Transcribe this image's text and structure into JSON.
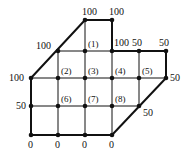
{
  "diagram": {
    "nodes": [
      {
        "id": "t1",
        "x": 85,
        "y": 20,
        "type": "boundary",
        "label": "100",
        "lx": -3,
        "ly": -5
      },
      {
        "id": "t2",
        "x": 112,
        "y": 20,
        "type": "boundary",
        "label": "100",
        "lx": -3,
        "ly": -5
      },
      {
        "id": "r1a",
        "x": 58,
        "y": 51,
        "type": "boundary",
        "label": "100",
        "lx": -22,
        "ly": -2
      },
      {
        "id": "n1",
        "x": 85,
        "y": 51,
        "type": "interior",
        "label": "(1)",
        "lx": 3,
        "ly": -4
      },
      {
        "id": "r1c",
        "x": 112,
        "y": 51,
        "type": "boundary",
        "label": "100",
        "lx": 2,
        "ly": -5
      },
      {
        "id": "r1d",
        "x": 139,
        "y": 51,
        "type": "boundary",
        "label": "50",
        "lx": -7,
        "ly": -5
      },
      {
        "id": "r1e",
        "x": 166,
        "y": 51,
        "type": "boundary",
        "label": "50",
        "lx": -7,
        "ly": -5
      },
      {
        "id": "r2a",
        "x": 31,
        "y": 78,
        "type": "boundary",
        "label": "100",
        "lx": -22,
        "ly": 3
      },
      {
        "id": "n2",
        "x": 58,
        "y": 78,
        "type": "interior",
        "label": "(2)",
        "lx": 3,
        "ly": -4
      },
      {
        "id": "n3",
        "x": 85,
        "y": 78,
        "type": "interior",
        "label": "(3)",
        "lx": 3,
        "ly": -4
      },
      {
        "id": "n4",
        "x": 112,
        "y": 78,
        "type": "interior",
        "label": "(4)",
        "lx": 3,
        "ly": -4
      },
      {
        "id": "n5",
        "x": 139,
        "y": 78,
        "type": "interior",
        "label": "(5)",
        "lx": 3,
        "ly": -4
      },
      {
        "id": "r2f",
        "x": 166,
        "y": 78,
        "type": "boundary",
        "label": "50",
        "lx": 4,
        "ly": 3
      },
      {
        "id": "r3a",
        "x": 31,
        "y": 106,
        "type": "boundary",
        "label": "50",
        "lx": -15,
        "ly": 3
      },
      {
        "id": "n6",
        "x": 58,
        "y": 106,
        "type": "interior",
        "label": "(6)",
        "lx": 3,
        "ly": -4
      },
      {
        "id": "n7",
        "x": 85,
        "y": 106,
        "type": "interior",
        "label": "(7)",
        "lx": 3,
        "ly": -4
      },
      {
        "id": "n8",
        "x": 112,
        "y": 106,
        "type": "interior",
        "label": "(8)",
        "lx": 3,
        "ly": -4
      },
      {
        "id": "r3e",
        "x": 139,
        "y": 106,
        "type": "boundary",
        "label": "50",
        "lx": 4,
        "ly": 10
      },
      {
        "id": "b1",
        "x": 31,
        "y": 135,
        "type": "boundary",
        "label": "0",
        "lx": -3,
        "ly": 13
      },
      {
        "id": "b2",
        "x": 58,
        "y": 135,
        "type": "boundary",
        "label": "0",
        "lx": -3,
        "ly": 13
      },
      {
        "id": "b3",
        "x": 85,
        "y": 135,
        "type": "boundary",
        "label": "0",
        "lx": -3,
        "ly": 13
      },
      {
        "id": "b4",
        "x": 112,
        "y": 135,
        "type": "boundary",
        "label": "0",
        "lx": -3,
        "ly": 13
      }
    ],
    "boundary_edges": [
      [
        85,
        20,
        112,
        20
      ],
      [
        112,
        20,
        112,
        51
      ],
      [
        112,
        51,
        166,
        51
      ],
      [
        166,
        51,
        166,
        78
      ],
      [
        166,
        78,
        112,
        135
      ],
      [
        112,
        135,
        31,
        135
      ],
      [
        31,
        135,
        31,
        78
      ],
      [
        31,
        78,
        85,
        20
      ]
    ],
    "grid_lines": [
      [
        58,
        51,
        112,
        51
      ],
      [
        31,
        78,
        166,
        78
      ],
      [
        31,
        106,
        139,
        106
      ],
      [
        58,
        51,
        58,
        135
      ],
      [
        85,
        20,
        85,
        135
      ],
      [
        112,
        51,
        112,
        135
      ],
      [
        139,
        51,
        139,
        106
      ]
    ],
    "colors": {
      "line": "#111111",
      "background": "#ffffff"
    }
  }
}
